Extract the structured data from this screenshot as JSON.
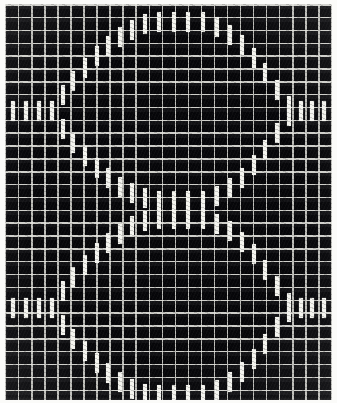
{
  "figure": {
    "title": "Sinusoidal trace on graph paper",
    "media": "scanned chart recorder plate",
    "background_color": "#07070a",
    "ink_color": "#f4f4ef",
    "grid_color": "#e4e4de",
    "paper_color": "#fbfbf9",
    "width_px": 337,
    "height_px": 403
  },
  "grid": {
    "columns": 25,
    "rows": 31,
    "cell_width_px": 13.05,
    "cell_height_px": 12.85,
    "visible": true
  },
  "chart_data": {
    "type": "scatter",
    "title": "Sinusoidal trace on graph paper",
    "subtitle": "",
    "xlabel": "",
    "ylabel": "",
    "xlim": [
      0,
      25
    ],
    "ylim": [
      0,
      31
    ],
    "grid": true,
    "legend": false,
    "marker": "vertical-bar",
    "marker_width_px": 4,
    "marker_height_px": 20,
    "series": [
      {
        "name": "rising-sine",
        "color": "#f4f4ef",
        "x": [
          0.6,
          1.6,
          2.6,
          3.6,
          4.4,
          5.2,
          6.1,
          7.0,
          7.9,
          8.8,
          9.7,
          10.7,
          11.8,
          12.9,
          14.0,
          15.1,
          16.2,
          17.2,
          18.1,
          19.0,
          19.9,
          20.8,
          21.7,
          22.6,
          23.5,
          24.4
        ],
        "y": [
          22.6,
          22.6,
          22.6,
          22.6,
          23.9,
          25.0,
          26.0,
          26.9,
          27.7,
          28.4,
          29.0,
          29.4,
          29.6,
          29.6,
          29.6,
          29.6,
          29.2,
          28.6,
          27.8,
          26.8,
          25.6,
          24.3,
          23.0,
          22.6,
          22.6,
          22.6
        ]
      },
      {
        "name": "falling-sine",
        "color": "#f4f4ef",
        "x": [
          0.6,
          1.6,
          2.6,
          3.6,
          4.4,
          5.2,
          6.1,
          7.0,
          7.9,
          8.8,
          9.7,
          10.7,
          11.8,
          12.9,
          14.0,
          15.1,
          16.2,
          17.2,
          18.1,
          19.0,
          19.9,
          20.8,
          21.7,
          22.6,
          23.5,
          24.4
        ],
        "y": [
          22.6,
          22.6,
          22.6,
          22.6,
          21.2,
          20.1,
          19.1,
          18.2,
          17.4,
          16.7,
          16.2,
          15.8,
          15.6,
          15.6,
          15.6,
          15.6,
          16.0,
          16.6,
          17.4,
          18.4,
          19.6,
          20.9,
          22.2,
          22.6,
          22.6,
          22.6
        ]
      },
      {
        "name": "rising-sine-lower",
        "color": "#f4f4ef",
        "x": [
          0.6,
          1.6,
          2.6,
          3.6,
          4.4,
          5.2,
          6.1,
          7.0,
          7.9,
          8.8,
          9.7,
          10.7,
          11.8,
          12.9,
          14.0,
          15.1,
          16.2,
          17.2,
          18.1,
          19.0,
          19.9,
          20.8,
          21.7,
          22.6,
          23.5,
          24.4
        ],
        "y": [
          7.2,
          7.2,
          7.2,
          7.2,
          8.5,
          9.6,
          10.6,
          11.5,
          12.3,
          13.0,
          13.6,
          14.0,
          14.2,
          14.2,
          14.2,
          14.2,
          13.8,
          13.2,
          12.4,
          11.4,
          10.2,
          8.9,
          7.6,
          7.2,
          7.2,
          7.2
        ]
      },
      {
        "name": "falling-sine-lower",
        "color": "#f4f4ef",
        "x": [
          0.6,
          1.6,
          2.6,
          3.6,
          4.4,
          5.2,
          6.1,
          7.0,
          7.9,
          8.8,
          9.7,
          10.7,
          11.8,
          12.9,
          14.0,
          15.1,
          16.2,
          17.2,
          18.1,
          19.0,
          19.9,
          20.8,
          21.7,
          22.6,
          23.5,
          24.4
        ],
        "y": [
          7.2,
          7.2,
          7.2,
          7.2,
          5.9,
          4.8,
          3.8,
          2.9,
          2.1,
          1.4,
          0.9,
          0.5,
          0.4,
          0.4,
          0.4,
          0.4,
          0.8,
          1.4,
          2.2,
          3.2,
          4.4,
          5.7,
          6.9,
          7.2,
          7.2,
          7.2
        ]
      }
    ]
  }
}
